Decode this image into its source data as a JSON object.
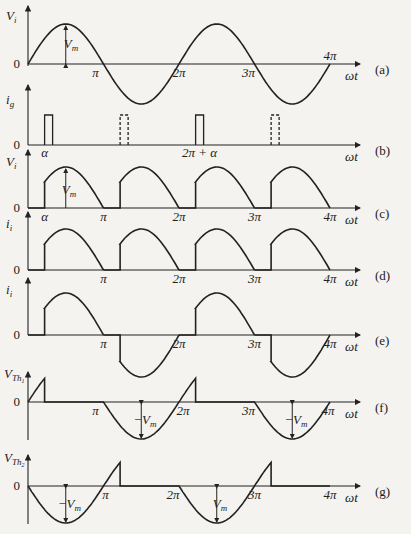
{
  "figure": {
    "x_axis_label": "ωt",
    "tick_labels": [
      "π",
      "2π",
      "3π",
      "4π"
    ],
    "zero_label": "0",
    "panels": [
      {
        "id": "a",
        "tag": "(a)",
        "ylabel": "V",
        "ylabel_sub": "i",
        "annotation": "V",
        "annotation_sub": "m",
        "description": "Input sinusoidal voltage over 0–4π"
      },
      {
        "id": "b",
        "tag": "(b)",
        "ylabel": "i",
        "ylabel_sub": "g",
        "alpha_label": "α",
        "alpha2_label": "2π + α",
        "description": "Gate pulses at α and 2π+α (solid), π+α and 3π+α (dashed)"
      },
      {
        "id": "c",
        "tag": "(c)",
        "ylabel": "V",
        "ylabel_sub": "i",
        "annotation": "V",
        "annotation_sub": "m",
        "alpha_label": "α",
        "description": "Output voltage, full-wave controlled rectified from α"
      },
      {
        "id": "d",
        "tag": "(d)",
        "ylabel": "i",
        "ylabel_sub": "i",
        "description": "Output current, same shape as output voltage"
      },
      {
        "id": "e",
        "tag": "(e)",
        "ylabel": "i",
        "ylabel_sub": "i",
        "description": "Input current, alternating controlled portions"
      },
      {
        "id": "f",
        "tag": "(f)",
        "ylabel": "V",
        "ylabel_sub": "Th",
        "ylabel_subsub": "1",
        "annotation": "−V",
        "annotation_sub": "m",
        "description": "Voltage across thyristor 1"
      },
      {
        "id": "g",
        "tag": "(g)",
        "ylabel": "V",
        "ylabel_sub": "Th",
        "ylabel_subsub": "2",
        "annotation": "−V",
        "annotation_sub": "m",
        "annotation2": "V",
        "annotation2_sub": "m",
        "description": "Voltage across thyristor 2"
      }
    ]
  }
}
